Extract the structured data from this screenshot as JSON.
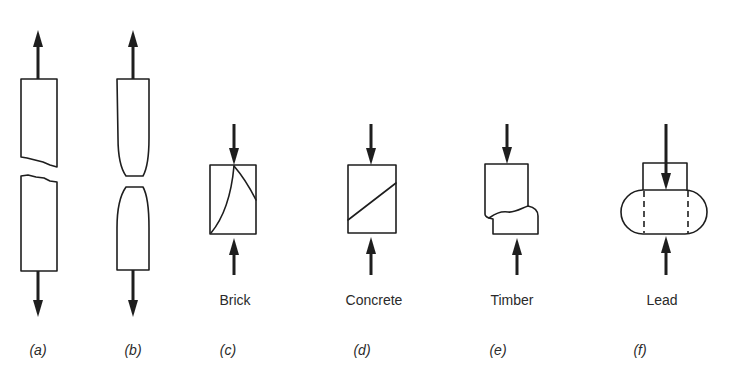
{
  "diagram": {
    "colors": {
      "line": "#1e1e1e",
      "background": "#ffffff"
    },
    "specimens": [
      {
        "id": "a",
        "figure_label": "(a)",
        "material": "",
        "load": "tension",
        "failure": "brittle fracture"
      },
      {
        "id": "b",
        "figure_label": "(b)",
        "material": "",
        "load": "tension",
        "failure": "ductile necking"
      },
      {
        "id": "c",
        "figure_label": "(c)",
        "material": "Brick",
        "load": "compression",
        "failure": "curved shear cracks"
      },
      {
        "id": "d",
        "figure_label": "(d)",
        "material": "Concrete",
        "load": "compression",
        "failure": "diagonal shear plane"
      },
      {
        "id": "e",
        "figure_label": "(e)",
        "material": "Timber",
        "load": "compression",
        "failure": "crushing / buckling of fibres"
      },
      {
        "id": "f",
        "figure_label": "(f)",
        "material": "Lead",
        "load": "compression",
        "failure": "plastic bulging"
      }
    ]
  }
}
